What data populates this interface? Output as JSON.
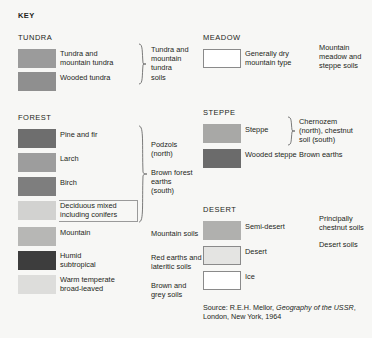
{
  "key": {
    "title": "KEY"
  },
  "groups": {
    "tundra": {
      "title": "TUNDRA",
      "items": [
        {
          "label": "Tundra and\nmountain tundra",
          "color": "#9b9b9b"
        },
        {
          "label": "Wooded tundra",
          "color": "#8f8f8f"
        }
      ],
      "soil": "Tundra and\nmountain\ntundra\nsoils"
    },
    "forest": {
      "title": "FOREST",
      "items": [
        {
          "label": "Pine and fir",
          "color": "#6e6e6e"
        },
        {
          "label": "Larch",
          "color": "#9d9d9d"
        },
        {
          "label": "Birch",
          "color": "#7e7e7e"
        },
        {
          "label": "Deciduous mixed\nincluding conifers",
          "color": "#d2d2d0"
        },
        {
          "label": "Mountain",
          "color": "#b7b7b5"
        },
        {
          "label": "Humid\nsubtropical",
          "color": "#3d3d3d"
        },
        {
          "label": "Warm temperate\nbroad-leaved",
          "color": "#dddddb"
        }
      ],
      "soil_podzols": "Podzols\n(north)",
      "soil_brown_forest": "Brown forest\nearths\n(south)",
      "soil_mountain": "Mountain soils",
      "soil_red_earths": "Red earths and\nlateritic soils",
      "soil_brown_grey": "Brown and\ngrey soils"
    },
    "meadow": {
      "title": "MEADOW",
      "items": [
        {
          "label": "Generally dry\nmountain type",
          "color": "#ffffff"
        }
      ],
      "soil": "Mountain\nmeadow and\nsteppe soils"
    },
    "steppe": {
      "title": "STEPPE",
      "items": [
        {
          "label": "Steppe",
          "color": "#a8a8a6"
        },
        {
          "label": "Wooded steppe",
          "color": "#6b6b6b"
        }
      ],
      "soil_chernozem": "Chernozem\n(north), chestnut\nsoil (south)",
      "soil_brown_earths": "Brown earths"
    },
    "desert": {
      "title": "DESERT",
      "items": [
        {
          "label": "Semi-desert",
          "color": "#b0b0ae"
        },
        {
          "label": "Desert",
          "color": "#e4e4e2"
        },
        {
          "label": "Ice",
          "color": "#ffffff"
        }
      ],
      "soil_chestnut": "Principally\nchestnut soils",
      "soil_desert": "Desert soils"
    }
  },
  "source": {
    "prefix": "Source: R.E.H. Mellor, ",
    "title": "Geography of the USSR",
    "suffix": ", London, New York, 1964"
  }
}
